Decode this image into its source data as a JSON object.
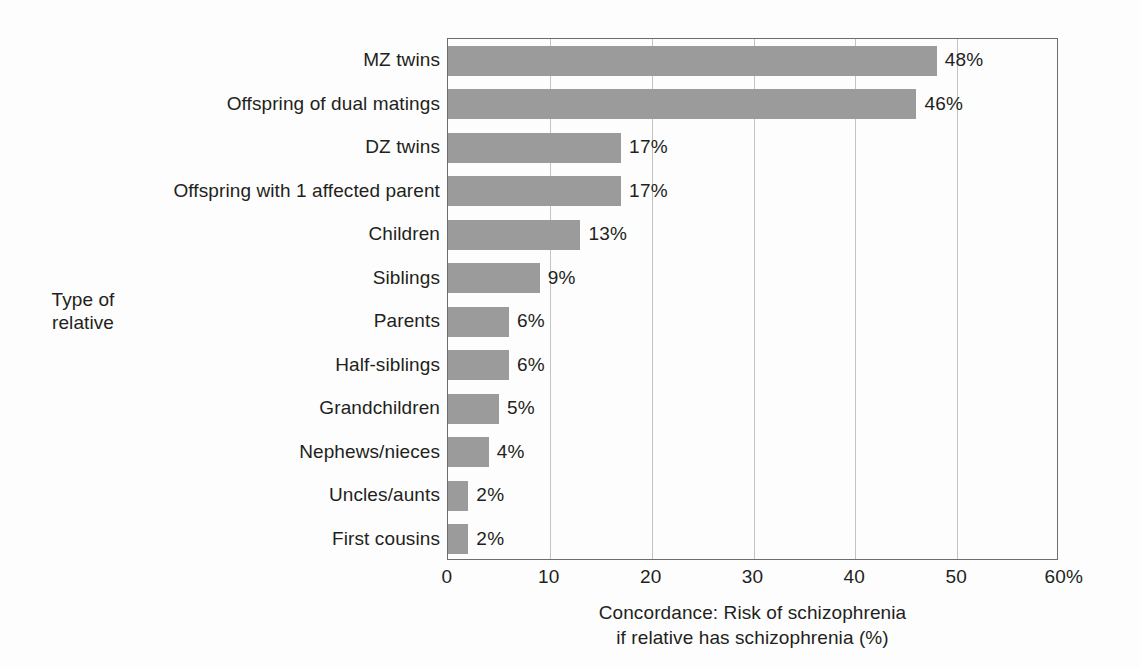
{
  "chart_data": {
    "type": "bar",
    "orientation": "horizontal",
    "title": "",
    "xlabel": "Concordance: Risk of schizophrenia if relative has schizophrenia (%)",
    "xlabel_line1": "Concordance: Risk of schizophrenia",
    "xlabel_line2": "if relative has schizophrenia (%)",
    "ylabel": "Type of relative",
    "ylabel_line1": "Type of",
    "ylabel_line2": "relative",
    "xlim": [
      0,
      60
    ],
    "xticks": [
      0,
      10,
      20,
      30,
      40,
      50,
      60
    ],
    "xtick_labels": [
      "0",
      "10",
      "20",
      "30",
      "40",
      "50",
      "60%"
    ],
    "grid": "vertical",
    "legend": "none",
    "bar_color": "#9b9b9b",
    "axis_color": "#6e6e6e",
    "gridline_color": "#c3c3c3",
    "categories": [
      "MZ twins",
      "Offspring of dual matings",
      "DZ twins",
      "Offspring with 1 affected parent",
      "Children",
      "Siblings",
      "Parents",
      "Half-siblings",
      "Grandchildren",
      "Nephews/nieces",
      "Uncles/aunts",
      "First cousins"
    ],
    "values": [
      48,
      46,
      17,
      17,
      13,
      9,
      6,
      6,
      5,
      4,
      2,
      2
    ],
    "value_labels": [
      "48%",
      "46%",
      "17%",
      "17%",
      "13%",
      "9%",
      "6%",
      "6%",
      "5%",
      "4%",
      "2%",
      "2%"
    ]
  }
}
